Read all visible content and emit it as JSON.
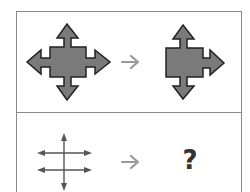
{
  "puzzle": {
    "rows": [
      {
        "input": {
          "icon": "four-way-arrow-square-icon",
          "arrows": [
            "up",
            "down",
            "left",
            "right"
          ]
        },
        "connector": "right-arrow-icon",
        "output": {
          "icon": "three-way-arrow-square-icon",
          "arrows": [
            "up",
            "down",
            "right"
          ]
        }
      },
      {
        "input": {
          "icon": "double-horizontal-cross-arrows-icon",
          "arrows": [
            "up",
            "down",
            "left",
            "right",
            "left",
            "right"
          ]
        },
        "connector": "right-arrow-icon",
        "output": {
          "unknown_label": "?"
        }
      }
    ]
  },
  "colors": {
    "shape_fill": "#7a7a7a",
    "shape_stroke": "#222222",
    "connector": "#9a9a9a",
    "line_arrows": "#555555",
    "border": "#8a8a8a"
  }
}
